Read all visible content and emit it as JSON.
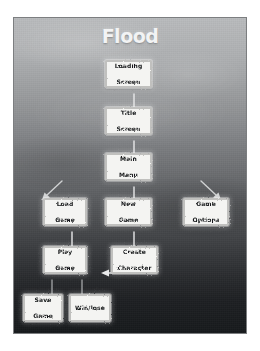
{
  "diagram": {
    "title": "Flood",
    "type": "flowchart",
    "nodes": [
      {
        "id": "loading-screen",
        "label": "Loading\nScreen",
        "line1": "Loading",
        "line2": "Screen",
        "x": 104,
        "y": 59,
        "w": 47,
        "h": 28
      },
      {
        "id": "title-screen",
        "label": "Title\nScreen",
        "line1": "Title",
        "line2": "Screen",
        "x": 104,
        "y": 106,
        "w": 47,
        "h": 28
      },
      {
        "id": "main-menu",
        "label": "Main\nMenu",
        "line1": "Main",
        "line2": "Menu",
        "x": 104,
        "y": 152,
        "w": 47,
        "h": 28
      },
      {
        "id": "load-game",
        "label": "Load\nGame",
        "line1": "Load",
        "line2": "Game",
        "x": 42,
        "y": 197,
        "w": 44,
        "h": 28
      },
      {
        "id": "new-game",
        "label": "New\nGame",
        "line1": "New",
        "line2": "Game",
        "x": 104,
        "y": 197,
        "w": 47,
        "h": 28
      },
      {
        "id": "game-options",
        "label": "Game\nOptions",
        "line1": "Game",
        "line2": "Options",
        "x": 182,
        "y": 197,
        "w": 46,
        "h": 28
      },
      {
        "id": "play-game",
        "label": "Play\nGame",
        "line1": "Play",
        "line2": "Game",
        "x": 42,
        "y": 245,
        "w": 44,
        "h": 28
      },
      {
        "id": "create-character",
        "label": "Create\nCharacter",
        "line1": "Create",
        "line2": "Character",
        "x": 110,
        "y": 245,
        "w": 47,
        "h": 28
      },
      {
        "id": "save-game",
        "label": "Save\nGame",
        "line1": "Save",
        "line2": "Game",
        "x": 22,
        "y": 293,
        "w": 40,
        "h": 28
      },
      {
        "id": "win-lose",
        "label": "Win/lose",
        "line1": "Win/lose",
        "line2": "",
        "x": 68,
        "y": 293,
        "w": 42,
        "h": 28
      }
    ],
    "edges": [
      {
        "id": "loading-to-title",
        "from": "loading-screen",
        "to": "title-screen",
        "direction": "down"
      },
      {
        "id": "title-to-main-menu",
        "from": "title-screen",
        "to": "main-menu",
        "direction": "down"
      },
      {
        "id": "main-menu-to-load-game",
        "from": "main-menu",
        "to": "load-game",
        "direction": "down-left"
      },
      {
        "id": "main-menu-to-new-game",
        "from": "main-menu",
        "to": "new-game",
        "direction": "down"
      },
      {
        "id": "main-menu-to-options",
        "from": "main-menu",
        "to": "game-options",
        "direction": "down-right"
      },
      {
        "id": "load-game-to-play-game",
        "from": "load-game",
        "to": "play-game",
        "direction": "down"
      },
      {
        "id": "new-game-to-create",
        "from": "new-game",
        "to": "create-character",
        "direction": "down"
      },
      {
        "id": "create-to-play-game",
        "from": "create-character",
        "to": "play-game",
        "direction": "left"
      },
      {
        "id": "play-game-to-save-game",
        "from": "play-game",
        "to": "save-game",
        "direction": "down"
      },
      {
        "id": "play-game-to-win-lose",
        "from": "play-game",
        "to": "win-lose",
        "direction": "down"
      }
    ]
  },
  "colors": {
    "panel_top": "#b9bbbd",
    "panel_bottom": "#171a1c",
    "node_fill": "#f4f4f2",
    "node_text": "#16181a",
    "title_text": "#f2f3f4",
    "arrow": "#e8e9ea",
    "page_background": "#ffffff"
  }
}
